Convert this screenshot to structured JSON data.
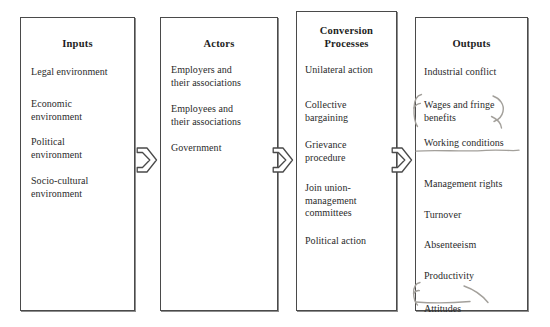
{
  "diagram": {
    "title": "Industrial Relations Systems Framework",
    "type": "flowchart",
    "boxes": [
      {
        "id": "inputs",
        "title": "Inputs",
        "items": [
          "Legal environment",
          "Economic\nenvironment",
          "Political\nenvironment",
          "Socio-cultural\nenvironment"
        ]
      },
      {
        "id": "actors",
        "title": "Actors",
        "items": [
          "Employers and\ntheir associations",
          "Employees and\ntheir associations",
          "Government"
        ]
      },
      {
        "id": "conversion-processes",
        "title": "Conversion\nProcesses",
        "items": [
          "Unilateral action",
          "Collective\nbargaining",
          "Grievance\nprocedure",
          "Join union-\nmanagement\ncommittees",
          "Political action"
        ]
      },
      {
        "id": "outputs",
        "title": "Outputs",
        "items": [
          "Industrial conflict",
          "Wages and fringe\nbenefits",
          "Working conditions",
          "Management rights",
          "Turnover",
          "Absenteeism",
          "Productivity",
          "Attitudes"
        ]
      }
    ],
    "connectors": [
      {
        "id": "arrow-inputs-to-actors",
        "icon": "right-arrow-icon"
      },
      {
        "id": "arrow-actors-to-conversion",
        "icon": "right-arrow-icon"
      },
      {
        "id": "arrow-conversion-to-outputs",
        "icon": "right-arrow-icon"
      }
    ],
    "annotations": [
      {
        "id": "circle-wages-and-fringe-benefits",
        "kind": "handwritten-circle",
        "target": "Wages and fringe benefits"
      },
      {
        "id": "underline-working-conditions",
        "kind": "handwritten-underline",
        "target": "Working conditions"
      },
      {
        "id": "circle-attitudes",
        "kind": "handwritten-circle",
        "target": "Attitudes"
      }
    ],
    "colors": {
      "box_border": "#4a4a4a",
      "box_shadow": "#8d8d8d",
      "text": "#2b2b2b",
      "title_text": "#1d1d1d",
      "annotation": "#9e9b96",
      "background": "#ffffff"
    }
  }
}
